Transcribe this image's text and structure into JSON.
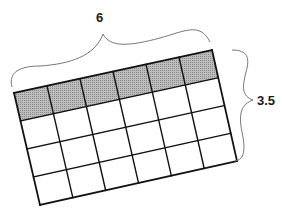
{
  "diagram": {
    "type": "grid-with-dimension-braces",
    "grid": {
      "columns": 6,
      "rows": 4,
      "shaded_rows": [
        0
      ],
      "shade_color": "#a8a8a8",
      "line_color": "#111111",
      "corners": {
        "top_left": [
          14,
          93
        ],
        "top_right": [
          212,
          50
        ],
        "bottom_right": [
          237,
          161
        ],
        "bottom_left": [
          40,
          205
        ]
      }
    },
    "width_label": "6",
    "height_label": "3.5"
  }
}
